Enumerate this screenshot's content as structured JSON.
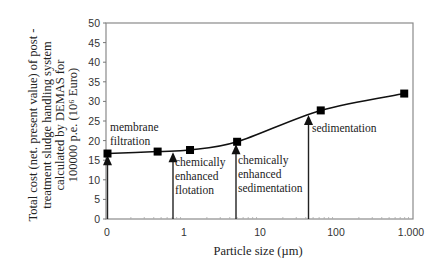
{
  "chart_data": {
    "type": "line",
    "title": "",
    "xlabel": "Particle size (µm)",
    "ylabel_lines": [
      "Total cost (net. present value) of post -",
      "treatment sludge handling system",
      "calculated by DEMAS for",
      "100000 p.e. (10⁶ Euro)"
    ],
    "x_scale": "log",
    "x_tick_labels": [
      "0",
      "1",
      "10",
      "100",
      "1.000"
    ],
    "y_ticks": [
      0,
      5,
      10,
      15,
      20,
      25,
      30,
      35,
      40,
      45,
      50
    ],
    "ylim": [
      0,
      50
    ],
    "grid": false,
    "legend": null,
    "series": [
      {
        "name": "Total cost",
        "marker": "square",
        "x": [
          0,
          0.45,
          1.2,
          5,
          63,
          790
        ],
        "values": [
          16.7,
          17.2,
          17.6,
          19.7,
          27.7,
          32.0
        ]
      }
    ],
    "annotations": [
      {
        "label": "membrane filtration",
        "lines": [
          "membrane",
          "filtration"
        ],
        "x": 0,
        "y": 16.5
      },
      {
        "label": "chemically enhanced flotation",
        "lines": [
          "chemically",
          "enhanced",
          "flotation"
        ],
        "x": 0.72,
        "y": 17.3
      },
      {
        "label": "chemically enhanced sedimentation",
        "lines": [
          "chemically",
          "enhanced",
          "sedimentation"
        ],
        "x": 4.8,
        "y": 19.3
      },
      {
        "label": "sedimentation",
        "lines": [
          "sedimentation"
        ],
        "x": 42,
        "y": 26.8
      }
    ]
  }
}
